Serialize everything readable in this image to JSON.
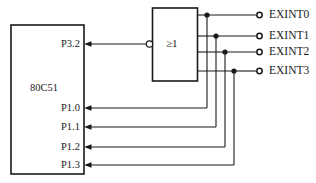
{
  "diagram": {
    "colors": {
      "line": "#1a1a1a",
      "text": "#1a1a1a",
      "background": "#ffffff"
    },
    "chip": {
      "name": "80C51",
      "pins": [
        {
          "label": "P3.2",
          "direction": "input",
          "y": 44
        },
        {
          "label": "P1.0",
          "direction": "input",
          "y": 108
        },
        {
          "label": "P1.1",
          "direction": "input",
          "y": 127
        },
        {
          "label": "P1.2",
          "direction": "input",
          "y": 147
        },
        {
          "label": "P1.3",
          "direction": "input",
          "y": 165
        }
      ]
    },
    "gate": {
      "label": "≥1",
      "type": "or-gate",
      "output_inverted": true,
      "inputs": 4
    },
    "terminals": [
      {
        "label": "EXINT0",
        "y": 15
      },
      {
        "label": "EXINT1",
        "y": 36
      },
      {
        "label": "EXINT2",
        "y": 52
      },
      {
        "label": "EXINT3",
        "y": 71
      }
    ]
  }
}
